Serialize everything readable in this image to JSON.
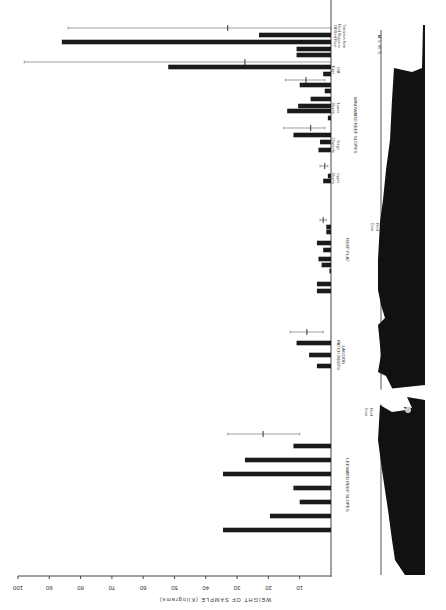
{
  "chart_data": {
    "type": "bar",
    "orientation": "horizontal",
    "title": "",
    "xlabel": "WEIGHT OF SAMPLE (Kilograms)",
    "ylabel": "",
    "xlim": [
      0,
      100
    ],
    "x_ticks": [
      10,
      20,
      30,
      40,
      50,
      60,
      70,
      80,
      90,
      100
    ],
    "grid": false,
    "legend": null,
    "zones": [
      {
        "name": "Transition from Reef Slopes to Off-Reef Floor",
        "group": "WINDWARD",
        "values": [
          23,
          86,
          11,
          11
        ],
        "error_bar": {
          "mean": 33,
          "min": 0,
          "max": 84
        }
      },
      {
        "name": "Cliff Edge",
        "group": "WINDWARD REEF SLOPES",
        "values": [
          52,
          2.5
        ],
        "error_bar": {
          "mean": 27.5,
          "min": 0,
          "max": 98
        }
      },
      {
        "name": "Lower Slopes",
        "group": "WINDWARD REEF SLOPES",
        "values": [
          10,
          2,
          6.5,
          10.5,
          14,
          1
        ],
        "error_bar": {
          "mean": 8,
          "min": 2,
          "max": 14.5
        }
      },
      {
        "name": "Surge Channels",
        "group": "WINDWARD REEF SLOPES",
        "values": [
          12,
          3.5,
          4
        ],
        "error_bar": {
          "mean": 6.5,
          "min": 2,
          "max": 15
        }
      },
      {
        "name": "Upper Slopes",
        "group": "WINDWARD REEF SLOPES",
        "values": [
          1,
          2.5
        ],
        "error_bar": {
          "mean": 2,
          "min": 1,
          "max": 3.5
        }
      },
      {
        "name": "REEF FLAT",
        "group": "REEF FLAT",
        "values": [
          1.5,
          1.5,
          4.5,
          2.5,
          4,
          3,
          0.5,
          4.5,
          4.5
        ],
        "error_bar": {
          "mean": 2.5,
          "min": 1.5,
          "max": 3.5
        }
      },
      {
        "name": "LAGOON PATCH REEFS",
        "group": "LAGOON",
        "values": [
          11,
          7,
          4.5
        ],
        "error_bar": {
          "mean": 7.7,
          "min": 2.5,
          "max": 13
        }
      },
      {
        "name": "LEEWARD REEF SLOPES",
        "group": "LEEWARD",
        "values": [
          12,
          27.5,
          34.5,
          12,
          10,
          19.5,
          34.5
        ],
        "error_bar": {
          "mean": 21.7,
          "min": 10,
          "max": 33
        }
      }
    ],
    "annotations": [
      "M. L. W. S.",
      "Reef Crest",
      "Reef Crest"
    ]
  },
  "labels": {
    "axis_title": "WEIGHT OF SAMPLE (Kilograms)",
    "transition": [
      "Transition from",
      "Reef Slopes to",
      "Off-Reef Floor"
    ],
    "cliff": [
      "Cliff",
      "Edge"
    ],
    "lower": [
      "Lower",
      "Slopes"
    ],
    "surge": [
      "Surge",
      "Channels"
    ],
    "upper": [
      "Upper",
      "Slopes"
    ],
    "windward": "WINDWARD   REEF   SLOPES",
    "reef_flat": "REEF   FLAT",
    "lagoon": [
      "LAGOON",
      "PATCH  REEFS"
    ],
    "leeward": "LEEWARD   REEF   SLOPES",
    "mlws": "M. L. W. S.",
    "reef_crest": [
      "Reef",
      "Crest"
    ]
  }
}
